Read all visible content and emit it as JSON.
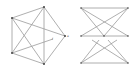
{
  "diagram": {
    "colors": {
      "edge": "#9a9a9a",
      "node": "#444444",
      "label": "#666666"
    },
    "graphs": [
      {
        "id": "left-graph",
        "nodes": [
          "A",
          "B",
          "C",
          "D",
          "E",
          "F"
        ],
        "edges": [
          [
            "A",
            "B"
          ],
          [
            "A",
            "C"
          ],
          [
            "A",
            "E"
          ],
          [
            "A",
            "D"
          ],
          [
            "B",
            "D"
          ],
          [
            "B",
            "E"
          ],
          [
            "B",
            "C"
          ],
          [
            "D",
            "E"
          ],
          [
            "E",
            "C"
          ],
          [
            "D",
            "F"
          ]
        ],
        "labels": {
          "F": "f"
        }
      },
      {
        "id": "right-graph",
        "nodes": [
          "T1",
          "T2",
          "M1",
          "M2",
          "M3",
          "B1",
          "B2"
        ],
        "edges": [
          [
            "T1",
            "T2"
          ],
          [
            "T1",
            "M3"
          ],
          [
            "T2",
            "M1"
          ],
          [
            "M1",
            "M3"
          ],
          [
            "B1",
            "B2"
          ],
          [
            "B1",
            "M3"
          ],
          [
            "B2",
            "M1"
          ],
          [
            "T1",
            "M2"
          ],
          [
            "T2",
            "M2"
          ]
        ],
        "labels": {
          "side": "a",
          "M1": "u",
          "M2": "v",
          "M3": "w"
        }
      }
    ]
  }
}
